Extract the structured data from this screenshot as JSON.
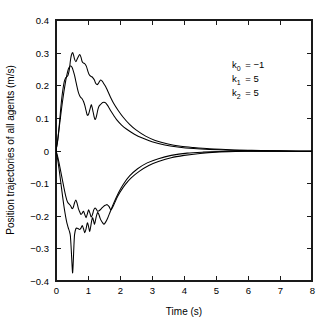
{
  "chart_data": {
    "type": "line",
    "title": "",
    "xlabel": "Time (s)",
    "ylabel": "Position trajectories of all agents (m/s)",
    "xlim": [
      0,
      8
    ],
    "ylim": [
      -0.4,
      0.4
    ],
    "xticks": [
      "0",
      "1",
      "2",
      "3",
      "4",
      "5",
      "6",
      "7",
      "8"
    ],
    "yticks": [
      "0.4",
      "0.3",
      "0.2",
      "0.1",
      "0",
      "−0.1",
      "−0.2",
      "−0.3",
      "−0.4"
    ],
    "grid": false,
    "legend_position": "none",
    "line_color": "#000000",
    "annotations": [
      {
        "symbol": "k",
        "subscript": "0",
        "equals": "=",
        "value": "−1"
      },
      {
        "symbol": "k",
        "subscript": "1",
        "equals": "=",
        "value": "5"
      },
      {
        "symbol": "k",
        "subscript": "2",
        "equals": "=",
        "value": "5"
      }
    ],
    "series": [
      {
        "name": "agent-1",
        "x": [
          0.0,
          0.05,
          0.1,
          0.14,
          0.18,
          0.22,
          0.26,
          0.3,
          0.34,
          0.38,
          0.42,
          0.45,
          0.48,
          0.52,
          0.55,
          0.58,
          0.62,
          0.66,
          0.7,
          0.74,
          0.78,
          0.82,
          0.86,
          0.9,
          0.95,
          1.0,
          1.04,
          1.08,
          1.12,
          1.16,
          1.2,
          1.24,
          1.28,
          1.32,
          1.36,
          1.4,
          1.45,
          1.5,
          1.55,
          1.6,
          1.7,
          1.8,
          1.95,
          2.1,
          2.3,
          2.5,
          2.8,
          3.1,
          3.5,
          3.9,
          4.3,
          4.8,
          5.3,
          5.8,
          6.4,
          7.0,
          7.6,
          8.0
        ],
        "y": [
          0.0,
          0.03,
          0.075,
          0.12,
          0.16,
          0.19,
          0.212,
          0.222,
          0.226,
          0.232,
          0.25,
          0.275,
          0.292,
          0.3,
          0.292,
          0.28,
          0.272,
          0.28,
          0.288,
          0.294,
          0.286,
          0.272,
          0.268,
          0.266,
          0.258,
          0.242,
          0.232,
          0.228,
          0.226,
          0.222,
          0.216,
          0.206,
          0.202,
          0.205,
          0.212,
          0.216,
          0.212,
          0.204,
          0.196,
          0.186,
          0.164,
          0.145,
          0.122,
          0.102,
          0.08,
          0.063,
          0.044,
          0.031,
          0.02,
          0.013,
          0.009,
          0.005,
          0.003,
          0.001,
          0.0,
          -0.001,
          -0.002,
          -0.002
        ]
      },
      {
        "name": "agent-2",
        "x": [
          0.0,
          0.05,
          0.1,
          0.15,
          0.2,
          0.25,
          0.3,
          0.34,
          0.38,
          0.42,
          0.46,
          0.5,
          0.54,
          0.58,
          0.62,
          0.66,
          0.7,
          0.74,
          0.78,
          0.82,
          0.86,
          0.9,
          0.94,
          0.98,
          1.02,
          1.06,
          1.1,
          1.13,
          1.16,
          1.19,
          1.22,
          1.25,
          1.28,
          1.31,
          1.34,
          1.38,
          1.42,
          1.46,
          1.5,
          1.55,
          1.6,
          1.65,
          1.72,
          1.8,
          1.9,
          2.05,
          2.2,
          2.45,
          2.7,
          3.0,
          3.4,
          3.8,
          4.3,
          4.8,
          5.4,
          6.0,
          6.8,
          7.5,
          8.0
        ],
        "y": [
          0.0,
          0.028,
          0.07,
          0.11,
          0.148,
          0.182,
          0.212,
          0.232,
          0.248,
          0.256,
          0.26,
          0.255,
          0.244,
          0.23,
          0.212,
          0.194,
          0.178,
          0.168,
          0.162,
          0.158,
          0.15,
          0.138,
          0.122,
          0.108,
          0.112,
          0.126,
          0.14,
          0.132,
          0.118,
          0.104,
          0.095,
          0.1,
          0.112,
          0.126,
          0.135,
          0.14,
          0.144,
          0.147,
          0.148,
          0.146,
          0.14,
          0.132,
          0.12,
          0.108,
          0.094,
          0.078,
          0.066,
          0.05,
          0.038,
          0.027,
          0.017,
          0.011,
          0.006,
          0.003,
          0.001,
          0.0,
          -0.001,
          -0.002,
          -0.002
        ]
      },
      {
        "name": "agent-3",
        "x": [
          0.0,
          0.06,
          0.12,
          0.18,
          0.24,
          0.3,
          0.36,
          0.42,
          0.46,
          0.5,
          0.54,
          0.58,
          0.62,
          0.66,
          0.7,
          0.74,
          0.78,
          0.82,
          0.86,
          0.9,
          0.94,
          0.98,
          1.02,
          1.06,
          1.1,
          1.14,
          1.18,
          1.22,
          1.26,
          1.3,
          1.36,
          1.42,
          1.48,
          1.54,
          1.6,
          1.66,
          1.72,
          1.8,
          1.9,
          2.0,
          2.15,
          2.35,
          2.6,
          2.9,
          3.2,
          3.6,
          4.0,
          4.5,
          5.0,
          5.6,
          6.2,
          6.9,
          7.5,
          8.0
        ],
        "y": [
          0.0,
          -0.022,
          -0.05,
          -0.08,
          -0.11,
          -0.138,
          -0.158,
          -0.165,
          -0.17,
          -0.178,
          -0.174,
          -0.16,
          -0.152,
          -0.162,
          -0.178,
          -0.188,
          -0.196,
          -0.192,
          -0.186,
          -0.196,
          -0.206,
          -0.194,
          -0.182,
          -0.192,
          -0.204,
          -0.196,
          -0.182,
          -0.176,
          -0.18,
          -0.186,
          -0.184,
          -0.178,
          -0.172,
          -0.168,
          -0.166,
          -0.172,
          -0.182,
          -0.168,
          -0.146,
          -0.128,
          -0.106,
          -0.084,
          -0.064,
          -0.046,
          -0.034,
          -0.022,
          -0.015,
          -0.009,
          -0.005,
          -0.003,
          -0.002,
          -0.002,
          -0.002,
          -0.002
        ]
      },
      {
        "name": "agent-4",
        "x": [
          0.0,
          0.05,
          0.1,
          0.15,
          0.2,
          0.25,
          0.3,
          0.34,
          0.38,
          0.42,
          0.45,
          0.48,
          0.5,
          0.52,
          0.54,
          0.56,
          0.58,
          0.62,
          0.66,
          0.7,
          0.74,
          0.78,
          0.82,
          0.86,
          0.9,
          0.94,
          0.98,
          1.02,
          1.05,
          1.08,
          1.11,
          1.14,
          1.17,
          1.2,
          1.23,
          1.26,
          1.3,
          1.34,
          1.38,
          1.42,
          1.46,
          1.5,
          1.56,
          1.62,
          1.7,
          1.8,
          1.95,
          2.1,
          2.3,
          2.55,
          2.85,
          3.2,
          3.6,
          4.1,
          4.6,
          5.2,
          5.9,
          6.6,
          7.3,
          8.0
        ],
        "y": [
          0.0,
          -0.026,
          -0.06,
          -0.098,
          -0.136,
          -0.172,
          -0.202,
          -0.222,
          -0.236,
          -0.248,
          -0.262,
          -0.31,
          -0.348,
          -0.375,
          -0.34,
          -0.292,
          -0.258,
          -0.24,
          -0.238,
          -0.24,
          -0.242,
          -0.238,
          -0.23,
          -0.24,
          -0.252,
          -0.24,
          -0.222,
          -0.234,
          -0.248,
          -0.236,
          -0.218,
          -0.206,
          -0.214,
          -0.226,
          -0.216,
          -0.202,
          -0.19,
          -0.196,
          -0.208,
          -0.216,
          -0.222,
          -0.226,
          -0.218,
          -0.206,
          -0.186,
          -0.162,
          -0.13,
          -0.104,
          -0.078,
          -0.056,
          -0.038,
          -0.025,
          -0.015,
          -0.008,
          -0.005,
          -0.003,
          -0.002,
          -0.002,
          -0.002,
          -0.002
        ]
      }
    ]
  },
  "caption": {
    "text": ""
  }
}
